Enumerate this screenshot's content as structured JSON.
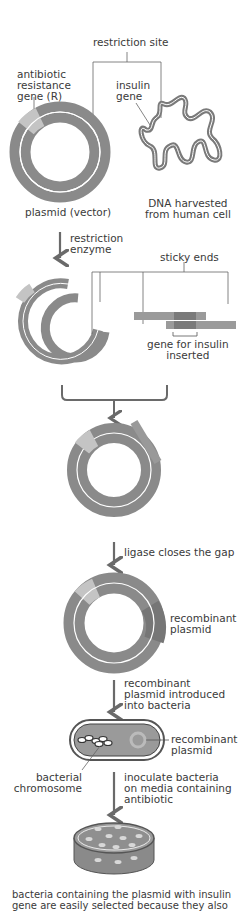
{
  "colors": {
    "ring": "#8a8a8a",
    "ring_light": "#bdbdbd",
    "ring_dark": "#6f6f6f",
    "line": "#555555",
    "arrow": "#6a6a6a",
    "text": "#3a3a3a"
  },
  "step1": {
    "restriction_site": "restriction site",
    "antibiotic_gene": [
      "antibiotic",
      "resistance",
      "gene (R)"
    ],
    "insulin_gene": [
      "insulin",
      "gene"
    ],
    "plasmid": "plasmid (vector)",
    "dna": [
      "DNA harvested",
      "from human cell"
    ]
  },
  "step2": {
    "arrow_label": [
      "restriction",
      "enzyme"
    ],
    "sticky_ends": "sticky ends",
    "gene_inserted": [
      "gene for insulin",
      "inserted"
    ]
  },
  "step3": {
    "arrow_label": "ligase closes the gap",
    "recombinant": [
      "recombinant",
      "plasmid"
    ]
  },
  "step4": {
    "arrow_label": [
      "recombinant",
      "plasmid introduced",
      "into bacteria"
    ],
    "plasmid_label": [
      "recombinant",
      "plasmid"
    ],
    "chromosome_label": [
      "bacterial",
      "chromosome"
    ]
  },
  "step5": {
    "arrow_label": [
      "inoculate bacteria",
      "on media containing",
      "antibiotic"
    ],
    "caption": [
      "bacteria containing the plasmid with insulin",
      "gene are easily selected because they also"
    ]
  }
}
